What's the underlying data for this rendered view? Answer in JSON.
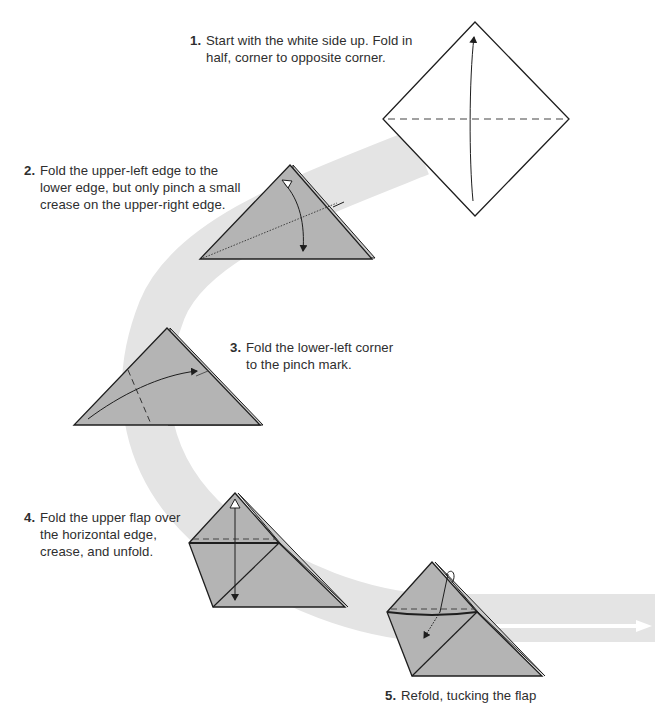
{
  "colors": {
    "paper": "#b4b4b4",
    "paper_edge": "#1e1e1e",
    "band": "#e4e4e4",
    "text": "#2e2e2e",
    "diamond_fill": "#ffffff"
  },
  "steps": [
    {
      "number": "1.",
      "lines": [
        "Start with the white side up. Fold in",
        "half, corner to opposite corner."
      ]
    },
    {
      "number": "2.",
      "lines": [
        "Fold the upper-left edge to the",
        "lower edge, but only pinch a small",
        "crease on the upper-right edge."
      ]
    },
    {
      "number": "3.",
      "lines": [
        "Fold the lower-left corner",
        "to the pinch mark."
      ]
    },
    {
      "number": "4.",
      "lines": [
        "Fold the upper flap over",
        "the horizontal edge,",
        "crease, and unfold."
      ]
    },
    {
      "number": "5.",
      "lines": [
        "Refold, tucking the flap"
      ]
    }
  ],
  "figures": [
    {
      "id": "step-1-diamond",
      "shape": "square-diamond",
      "marks": [
        "valley-fold-dashed-horizontal",
        "fold-arrow-up"
      ]
    },
    {
      "id": "step-2-triangle",
      "shape": "triangle",
      "marks": [
        "pinch-crease-dotted",
        "fold-unfold-arrow"
      ]
    },
    {
      "id": "step-3-triangle",
      "shape": "triangle",
      "marks": [
        "valley-fold-dashed",
        "fold-arrow-right"
      ]
    },
    {
      "id": "step-4-shape",
      "shape": "folded-triangle",
      "marks": [
        "valley-fold-dashed-horizontal",
        "fold-unfold-arrow-vertical"
      ]
    },
    {
      "id": "step-5-shape",
      "shape": "folded-triangle",
      "marks": [
        "valley-fold-dashed-horizontal",
        "tuck-arrow-dotted"
      ]
    }
  ],
  "flow_band": {
    "description": "light gray curved flow path connecting steps, ending in right-pointing arrow"
  }
}
